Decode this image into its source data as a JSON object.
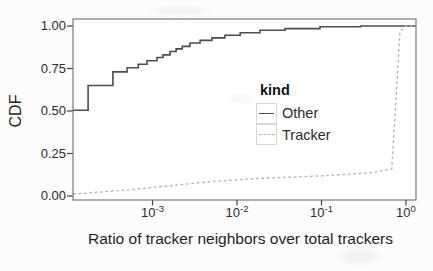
{
  "figure": {
    "x_axis_title": "Ratio of tracker neighbors over total trackers",
    "y_axis_title": "CDF",
    "y_tick_labels": [
      "1.00",
      "0.75",
      "0.50",
      "0.25",
      "0.00"
    ],
    "x_tick_labels": [
      {
        "base": "10",
        "exp": "-3"
      },
      {
        "base": "10",
        "exp": "-2"
      },
      {
        "base": "10",
        "exp": "-1"
      },
      {
        "base": "10",
        "exp": "0"
      }
    ]
  },
  "legend": {
    "title": "kind",
    "entries": [
      {
        "label": "Other",
        "line_style": "solid"
      },
      {
        "label": "Tracker",
        "line_style": "dashed"
      }
    ]
  },
  "colors": {
    "other_line": "#4d4d4d",
    "tracker_line": "#b3b3b3",
    "panel_border": "#6e6e6e",
    "tick": "#444444",
    "text": "#2b2b2b"
  },
  "chart_data": {
    "type": "line",
    "title": "",
    "xlabel": "Ratio of tracker neighbors over total trackers",
    "ylabel": "CDF",
    "x_scale": "log10",
    "xlim": [
      0.000115,
      1.3
    ],
    "ylim": [
      0.0,
      1.0
    ],
    "x_ticks": [
      0.001,
      0.01,
      0.1,
      1
    ],
    "y_ticks": [
      1.0,
      0.75,
      0.5,
      0.25,
      0.0
    ],
    "grid": false,
    "legend_title": "kind",
    "legend_position": "inside-right-center",
    "series": [
      {
        "name": "Other",
        "style": "solid",
        "color": "#4d4d4d",
        "step": true,
        "points": [
          [
            0.000115,
            0.505
          ],
          [
            0.000173,
            0.65
          ],
          [
            0.00034,
            0.73
          ],
          [
            0.0005,
            0.755
          ],
          [
            0.00068,
            0.775
          ],
          [
            0.00086,
            0.795
          ],
          [
            0.00113,
            0.815
          ],
          [
            0.00133,
            0.83
          ],
          [
            0.00161,
            0.85
          ],
          [
            0.0019,
            0.865
          ],
          [
            0.00225,
            0.88
          ],
          [
            0.00278,
            0.9
          ],
          [
            0.00366,
            0.915
          ],
          [
            0.00505,
            0.93
          ],
          [
            0.0072,
            0.945
          ],
          [
            0.0109,
            0.96
          ],
          [
            0.0187,
            0.975
          ],
          [
            0.037,
            0.985
          ],
          [
            0.096,
            0.995
          ],
          [
            0.29,
            1.0
          ],
          [
            1.3,
            1.0
          ]
        ]
      },
      {
        "name": "Tracker",
        "style": "dashed",
        "color": "#b3b3b3",
        "step": false,
        "points": [
          [
            0.000115,
            0.012
          ],
          [
            0.0002,
            0.02
          ],
          [
            0.0003,
            0.027
          ],
          [
            0.0005,
            0.035
          ],
          [
            0.001,
            0.05
          ],
          [
            0.002,
            0.065
          ],
          [
            0.005,
            0.085
          ],
          [
            0.01,
            0.095
          ],
          [
            0.02,
            0.105
          ],
          [
            0.05,
            0.112
          ],
          [
            0.1,
            0.118
          ],
          [
            0.2,
            0.127
          ],
          [
            0.4,
            0.138
          ],
          [
            0.68,
            0.16
          ],
          [
            0.85,
            0.97
          ],
          [
            1.0,
            1.0
          ],
          [
            1.3,
            1.0
          ]
        ]
      }
    ]
  }
}
